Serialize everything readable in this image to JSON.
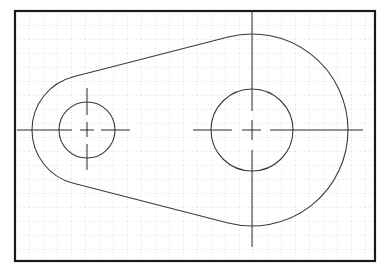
{
  "drawing": {
    "title": "CAD sketch: two-hole link plate with center lines",
    "colors": {
      "background": "#ffffff",
      "frame": "#1a1a1a",
      "grid": "#b8b8b8",
      "geometry": "#3a3a3a",
      "centerline": "#2a2a2a"
    },
    "frame": {
      "x": 15,
      "y": 11,
      "width": 360,
      "height": 250
    },
    "grid_spacing": 14,
    "outer_profile": {
      "small_end": {
        "cx": 87,
        "cy": 130,
        "r": 55
      },
      "large_end": {
        "cx": 252,
        "cy": 130,
        "r": 96
      }
    },
    "holes": [
      {
        "name": "small-hole",
        "cx": 87,
        "cy": 130,
        "r": 28
      },
      {
        "name": "large-hole",
        "cx": 252,
        "cy": 130,
        "r": 41
      }
    ],
    "centerlines": [
      {
        "name": "small-horizontal",
        "segments": [
          [
            17,
            130,
            72,
            130
          ],
          [
            80,
            130,
            94,
            130
          ],
          [
            101,
            130,
            130,
            130
          ]
        ]
      },
      {
        "name": "small-vertical",
        "segments": [
          [
            87,
            88,
            87,
            115
          ],
          [
            87,
            122,
            87,
            137
          ],
          [
            87,
            144,
            87,
            170
          ]
        ]
      },
      {
        "name": "large-horizontal",
        "segments": [
          [
            193,
            130,
            232,
            130
          ],
          [
            242,
            130,
            261,
            130
          ],
          [
            270,
            130,
            363,
            130
          ]
        ]
      },
      {
        "name": "large-vertical",
        "segments": [
          [
            252,
            11,
            252,
            111
          ],
          [
            252,
            120,
            252,
            140
          ],
          [
            252,
            150,
            252,
            247
          ]
        ]
      }
    ]
  }
}
